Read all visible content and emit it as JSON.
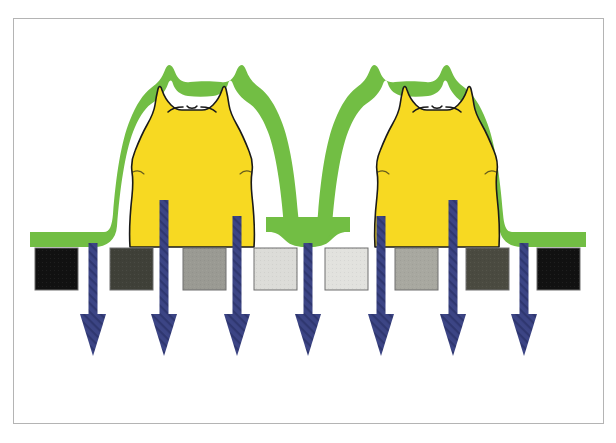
{
  "figure": {
    "frame": {
      "x": 13,
      "y": 18,
      "width": 591,
      "height": 406,
      "border_color": "#b4b4b4",
      "background": "#ffffff"
    },
    "canvas": {
      "width": 616,
      "height": 443,
      "background": "#ffffff"
    }
  },
  "palette": {
    "yellow_feature": "#F7D922",
    "green_coating": "#72BE44",
    "outline": "#1a1a1a",
    "arrow_blue": "#3C4585",
    "arrow_blue_dark": "#2E3670",
    "box_border": "#6e6e6e",
    "white": "#ffffff"
  },
  "substrate_line": {
    "label": "substrate-surface",
    "y": 246,
    "x_start": 35,
    "x_end": 580
  },
  "pads": {
    "label": "gradient-pads",
    "count": 9,
    "top": 248,
    "height": 42,
    "width": 43,
    "items": [
      {
        "index": 1,
        "name": "pad-1",
        "x": 35,
        "fill": "#111111",
        "tone_label": "black"
      },
      {
        "index": 2,
        "name": "pad-2",
        "x": 110,
        "fill": "#3f4038",
        "tone_label": "dark-gray"
      },
      {
        "index": 3,
        "name": "pad-3",
        "x": 183,
        "fill": "#9a9a93",
        "tone_label": "mid-gray"
      },
      {
        "index": 4,
        "name": "pad-4",
        "x": 254,
        "fill": "#dcdcd8",
        "tone_label": "light-gray"
      },
      {
        "index": 5,
        "name": "pad-5",
        "x": 325,
        "fill": "#e2e2de",
        "tone_label": "lightest-gray"
      },
      {
        "index": 6,
        "name": "pad-6",
        "x": 395,
        "fill": "#a8a8a0",
        "tone_label": "mid-gray"
      },
      {
        "index": 7,
        "name": "pad-7",
        "x": 466,
        "fill": "#4a4a40",
        "tone_label": "dark-gray"
      },
      {
        "index": 8,
        "name": "pad-8",
        "x": 537,
        "fill": "#111111",
        "tone_label": "black"
      }
    ]
  },
  "arrows": {
    "label": "downward-flux-arrows",
    "count": 7,
    "color": "#3C4585",
    "shaft_width": 9,
    "head_width": 26,
    "head_height": 42,
    "tip_y": 356,
    "items": [
      {
        "index": 1,
        "name": "arrow-1",
        "x": 93,
        "top": 243,
        "length": 113
      },
      {
        "index": 2,
        "name": "arrow-2",
        "x": 164,
        "top": 200,
        "length": 156
      },
      {
        "index": 3,
        "name": "arrow-3",
        "x": 237,
        "top": 216,
        "length": 140
      },
      {
        "index": 4,
        "name": "arrow-4",
        "x": 308,
        "top": 243,
        "length": 113
      },
      {
        "index": 5,
        "name": "arrow-5",
        "x": 381,
        "top": 216,
        "length": 140
      },
      {
        "index": 6,
        "name": "arrow-6",
        "x": 453,
        "top": 200,
        "length": 156
      },
      {
        "index": 7,
        "name": "arrow-7",
        "x": 524,
        "top": 243,
        "length": 113
      }
    ]
  },
  "features": {
    "label": "cat-shaped-yellow-features",
    "count": 2,
    "fill": "#F7D922",
    "outline": "#1a1a1a",
    "items": [
      {
        "index": 1,
        "name": "cat-feature-left",
        "center_x": 185,
        "base_y": 247,
        "top_y": 88
      },
      {
        "index": 2,
        "name": "cat-feature-right",
        "center_x": 430,
        "base_y": 247,
        "top_y": 88
      }
    ]
  },
  "coating": {
    "label": "green-conformal-coating",
    "fill": "#72BE44",
    "thickness": 14,
    "spans_substrate": true,
    "valley_between_features": true
  }
}
